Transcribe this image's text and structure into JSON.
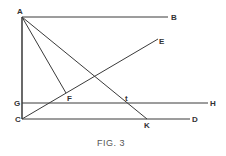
{
  "figure": {
    "caption": "FIG. 3",
    "colors": {
      "line": "#3a3a3a",
      "label": "#333333",
      "caption": "#555555",
      "background": "#ffffff"
    },
    "points": {
      "A": {
        "label": "A",
        "x": 22,
        "y": 17
      },
      "B": {
        "label": "B",
        "x": 168,
        "y": 17
      },
      "C": {
        "label": "C",
        "x": 22,
        "y": 119
      },
      "D": {
        "label": "D",
        "x": 190,
        "y": 119
      },
      "E": {
        "label": "E",
        "x": 158,
        "y": 39
      },
      "F": {
        "label": "F",
        "x": 66,
        "y": 93
      },
      "G": {
        "label": "G",
        "x": 22,
        "y": 103
      },
      "H": {
        "label": "H",
        "x": 208,
        "y": 103
      },
      "K": {
        "label": "K",
        "x": 147,
        "y": 119
      },
      "t": {
        "label": "t",
        "x": 128,
        "y": 103
      }
    },
    "segments": [
      "AB",
      "AC",
      "AF",
      "AK",
      "CE",
      "GH",
      "CD"
    ]
  }
}
